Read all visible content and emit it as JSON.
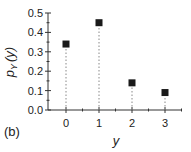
{
  "chart_data": {
    "type": "scatter",
    "style": "stem",
    "title": "",
    "panel_label": "(b)",
    "xlabel": "y",
    "ylabel": "p_Y (y)",
    "ylabel_main": "p",
    "ylabel_sub": "Y",
    "ylabel_arg": "(y)",
    "x": [
      0,
      1,
      2,
      3
    ],
    "values": [
      0.34,
      0.45,
      0.14,
      0.09
    ],
    "x_ticks": [
      "0",
      "1",
      "2",
      "3"
    ],
    "y_ticks": [
      "0.0",
      "0.1",
      "0.2",
      "0.3",
      "0.4",
      "0.5"
    ],
    "xlim": [
      -0.5,
      3.5
    ],
    "ylim": [
      0,
      0.5
    ],
    "grid": false,
    "legend": null,
    "marker": "square",
    "stem_line": "dotted",
    "colors": {
      "marker": "#1a1a1a",
      "axis": "#333333",
      "stem": "#888888"
    }
  }
}
